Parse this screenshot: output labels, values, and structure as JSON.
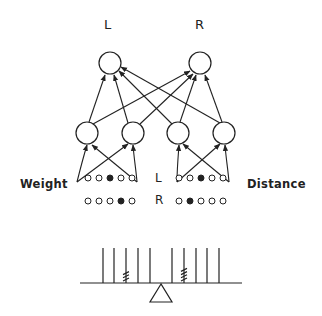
{
  "diagram": {
    "output_labels": {
      "left": "L",
      "right": "R"
    },
    "input_groups": {
      "weight": {
        "label": "Weight"
      },
      "distance": {
        "label": "Distance"
      }
    },
    "row_labels": {
      "left": "L",
      "right": "R"
    },
    "input_patterns": {
      "weight_left": [
        0,
        0,
        1,
        0,
        0
      ],
      "weight_right": [
        0,
        0,
        0,
        1,
        0
      ],
      "distance_left": [
        0,
        0,
        1,
        0,
        0
      ],
      "distance_right": [
        0,
        1,
        0,
        0,
        0
      ]
    },
    "balance_beam": {
      "pegs_per_side": 5,
      "left_weight_peg": 3,
      "left_weight_count": 3,
      "right_weight_peg": 2,
      "right_weight_count": 4
    },
    "colors": {
      "ink": "#222222",
      "background": "#ffffff"
    }
  }
}
